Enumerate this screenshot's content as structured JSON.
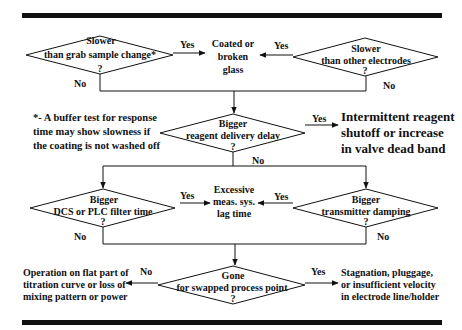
{
  "diagram": {
    "decisions": [
      {
        "id": "d1",
        "line1": "Slower",
        "line2": "than grab sample change*",
        "q": "?",
        "yes": "Yes",
        "no": "No"
      },
      {
        "id": "d2",
        "line1": "Slower",
        "line2": "than other electrodes",
        "q": "?",
        "yes": "Yes",
        "no": "No"
      },
      {
        "id": "d3",
        "line1": "Bigger",
        "line2": "reagent delivery delay",
        "q": "?",
        "yes": "Yes",
        "no": "No"
      },
      {
        "id": "d4",
        "line1": "Bigger",
        "line2": "DCS  or PLC filter time",
        "q": "?",
        "yes": "Yes",
        "no": "No"
      },
      {
        "id": "d5",
        "line1": "Bigger",
        "line2": "transmitter damping",
        "q": "?",
        "yes": "Yes",
        "no": "No"
      },
      {
        "id": "d6",
        "line1": "Gone",
        "line2": "for swapped process  point",
        "q": "?",
        "yes": "Yes",
        "no": "No"
      }
    ],
    "outcomes": {
      "coated": [
        "Coated or",
        "broken",
        "glass"
      ],
      "intermittent": [
        "Intermittent reagent",
        "shutoff or  increase",
        "in valve dead band"
      ],
      "excessive": [
        "Excessive",
        "meas. sys.",
        "lag time"
      ],
      "operation": [
        "Operation on flat part of",
        "titration curve or loss of",
        "mixing  pattern or power"
      ],
      "stagnation": [
        "Stagnation, pluggage,",
        "or insufficient velocity",
        "in electrode line/holder"
      ]
    },
    "footnote": [
      "*- A buffer test for response",
      "time  may show slowness if",
      "the coating is not washed off"
    ]
  }
}
